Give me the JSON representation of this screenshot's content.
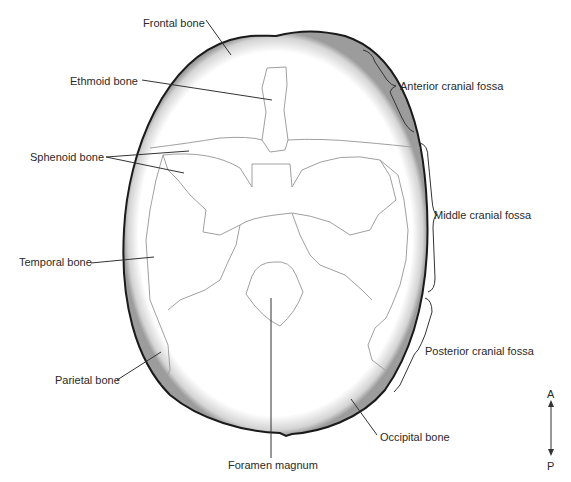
{
  "figure": {
    "colors": {
      "outline": "#1a1a1a",
      "suture": "#9a9a9a",
      "leader": "#333333",
      "text": "#2a2a2a",
      "shadow": "#bdbdbd"
    }
  },
  "labels": {
    "frontal": "Frontal bone",
    "ethmoid": "Ethmoid bone",
    "sphenoid": "Sphenoid bone",
    "temporal": "Temporal bone",
    "parietal": "Parietal bone",
    "foramen": "Foramen magnum",
    "occipital": "Occipital bone",
    "anterior_fossa": "Anterior cranial fossa",
    "middle_fossa": "Middle cranial fossa",
    "posterior_fossa": "Posterior cranial fossa"
  },
  "orientation": {
    "top": "A",
    "bottom": "P"
  }
}
